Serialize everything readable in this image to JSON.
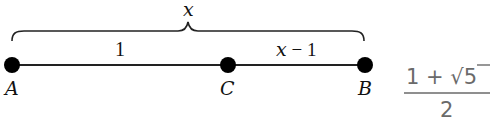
{
  "diagram": {
    "brace_label": "x",
    "segment_labels": {
      "ac": "1",
      "cb_var": "x",
      "cb_rest": " − 1"
    },
    "points": [
      {
        "name": "A"
      },
      {
        "name": "C"
      },
      {
        "name": "B"
      }
    ],
    "fraction": {
      "numerator_left": "1 + ",
      "radical_symbol": "√",
      "radicand": "5",
      "denominator": "2"
    },
    "colors": {
      "line": "#111111",
      "fraction_text": "#6a6a6a"
    }
  }
}
